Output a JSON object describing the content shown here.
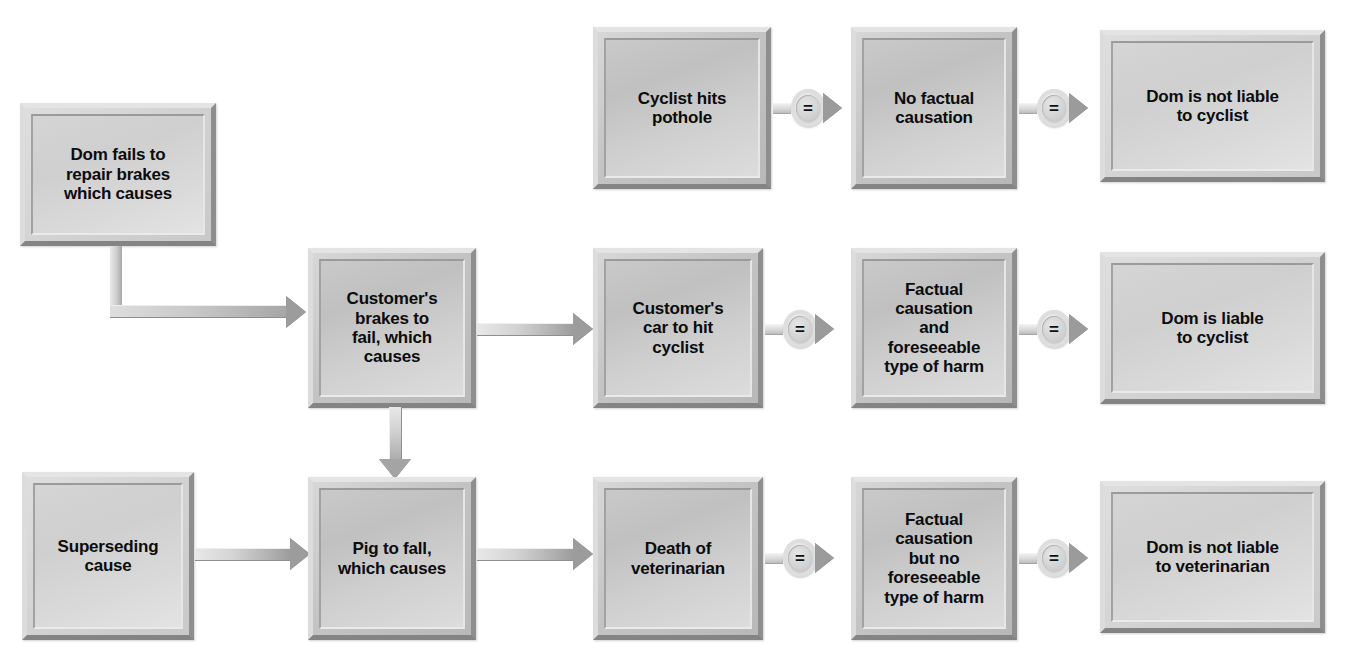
{
  "diagram": {
    "background_color": "#ffffff",
    "box_fill_color": "#c4c4c4",
    "box_light_fill_color": "#d5d5d5",
    "text_color": "#0c0c0c",
    "connector_color": "#9c9c9c",
    "equals_symbol": "=",
    "nodes": [
      {
        "id": "dom-fails",
        "label": "Dom fails to\nrepair brakes\nwhich causes"
      },
      {
        "id": "cyclist-hits-pothole",
        "label": "Cyclist hits\npothole"
      },
      {
        "id": "no-factual-causation",
        "label": "No factual\ncausation"
      },
      {
        "id": "dom-not-liable-cyclist",
        "label": "Dom is not liable\nto cyclist"
      },
      {
        "id": "customers-brakes-fail",
        "label": "Customer's\nbrakes to\nfail, which\ncauses"
      },
      {
        "id": "customers-car-hit",
        "label": "Customer's\ncar to hit\ncyclist"
      },
      {
        "id": "factual-foreseeable",
        "label": "Factual\ncausation\nand\nforeseeable\ntype of harm"
      },
      {
        "id": "dom-liable-cyclist",
        "label": "Dom is liable\nto cyclist"
      },
      {
        "id": "superseding-cause",
        "label": "Superseding\ncause"
      },
      {
        "id": "pig-to-fall",
        "label": "Pig to fall,\nwhich causes"
      },
      {
        "id": "death-of-vet",
        "label": "Death of\nveterinarian"
      },
      {
        "id": "factual-no-foreseeable",
        "label": "Factual\ncausation\nbut no\nforeseeable\ntype of harm"
      },
      {
        "id": "dom-not-liable-vet",
        "label": "Dom is not liable\nto veterinarian"
      }
    ],
    "connectors": [
      {
        "id": "pothole-to-nofactual",
        "type": "equals"
      },
      {
        "id": "nofactual-to-notliable",
        "type": "equals"
      },
      {
        "id": "domfails-to-brakes",
        "type": "elbow"
      },
      {
        "id": "brakes-to-car",
        "type": "arrow"
      },
      {
        "id": "car-to-factual",
        "type": "equals"
      },
      {
        "id": "factual-to-liable",
        "type": "equals"
      },
      {
        "id": "brakes-to-pig",
        "type": "arrow-down"
      },
      {
        "id": "superseding-to-pig",
        "type": "arrow"
      },
      {
        "id": "pig-to-death",
        "type": "arrow"
      },
      {
        "id": "death-to-factual",
        "type": "equals"
      },
      {
        "id": "factual-to-notliable",
        "type": "equals"
      }
    ]
  }
}
